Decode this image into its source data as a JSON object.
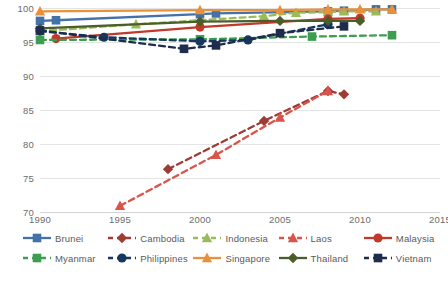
{
  "chart_data": {
    "type": "line",
    "title": "",
    "subtitle": "",
    "xlabel": "",
    "ylabel": "",
    "xlim": [
      1990,
      2015
    ],
    "ylim": [
      70,
      100
    ],
    "xticks": [
      1990,
      1995,
      2000,
      2005,
      2010,
      2015
    ],
    "yticks": [
      70,
      75,
      80,
      85,
      90,
      95,
      100
    ],
    "grid": "horizontal",
    "legend_position": "bottom",
    "legend_columns": 5,
    "background": "#ffffff",
    "gridline_color": "#e4e4e4",
    "tick_label_color": "#6c6c6c",
    "series": [
      {
        "name": "Brunei",
        "color": "#4472a8",
        "marker": "square",
        "dash": "solid",
        "x": [
          1990,
          1991,
          2000,
          2001,
          2008,
          2009,
          2011,
          2012
        ],
        "values": [
          98.1,
          98.2,
          99.1,
          99.2,
          99.5,
          99.6,
          99.8,
          99.8
        ]
      },
      {
        "name": "Cambodia",
        "color": "#9e3b35",
        "marker": "diamond",
        "dash": "dashed",
        "x": [
          1998,
          2004,
          2008,
          2009
        ],
        "values": [
          76.3,
          83.4,
          87.8,
          87.3
        ]
      },
      {
        "name": "Indonesia",
        "color": "#9bbb59",
        "marker": "triangle",
        "dash": "dashed",
        "x": [
          1990,
          1996,
          2004,
          2006,
          2008,
          2009,
          2011
        ],
        "values": [
          96.6,
          97.6,
          98.8,
          99.3,
          99.4,
          99.5,
          99.5
        ]
      },
      {
        "name": "Laos",
        "color": "#d9544a",
        "marker": "triangle",
        "dash": "dashed",
        "x": [
          1995,
          2001,
          2005,
          2008
        ],
        "values": [
          70.9,
          78.4,
          83.9,
          87.8
        ]
      },
      {
        "name": "Malaysia",
        "color": "#c0392b",
        "marker": "circle",
        "dash": "solid",
        "x": [
          1991,
          2000,
          2008,
          2010
        ],
        "values": [
          95.5,
          97.2,
          98.4,
          98.5
        ]
      },
      {
        "name": "Myanmar",
        "color": "#3d9e50",
        "marker": "square",
        "dash": "dashed",
        "x": [
          1990,
          2000,
          2007,
          2012
        ],
        "values": [
          95.3,
          95.4,
          95.8,
          96.0
        ]
      },
      {
        "name": "Philippines",
        "color": "#17375e",
        "marker": "circle",
        "dash": "dashed",
        "x": [
          1990,
          1994,
          2000,
          2003,
          2008
        ],
        "values": [
          96.6,
          95.7,
          95.1,
          95.3,
          97.6
        ]
      },
      {
        "name": "Singapore",
        "color": "#e8913a",
        "marker": "triangle",
        "dash": "solid",
        "x": [
          1990,
          2000,
          2005,
          2008,
          2010,
          2012
        ],
        "values": [
          99.5,
          99.7,
          99.7,
          99.8,
          99.8,
          99.8
        ]
      },
      {
        "name": "Thailand",
        "color": "#4a5e2a",
        "marker": "diamond",
        "dash": "solid",
        "x": [
          1990,
          2000,
          2005,
          2008,
          2010
        ],
        "values": [
          97.0,
          98.0,
          98.1,
          98.1,
          98.1
        ]
      },
      {
        "name": "Vietnam",
        "color": "#1f2d4d",
        "marker": "square",
        "dash": "dashed",
        "x": [
          1990,
          1999,
          2001,
          2005,
          2009
        ],
        "values": [
          96.7,
          94.0,
          94.5,
          96.3,
          97.3
        ]
      }
    ]
  },
  "axes": {
    "y_labels": [
      "100",
      "95",
      "90",
      "85",
      "80",
      "75",
      "70"
    ],
    "x_labels": [
      "1990",
      "1995",
      "2000",
      "2005",
      "2010",
      "2015"
    ]
  },
  "legend": {
    "row1": [
      {
        "label": "Brunei"
      },
      {
        "label": "Cambodia"
      },
      {
        "label": "Indonesia"
      },
      {
        "label": "Laos"
      },
      {
        "label": "Malaysia"
      }
    ],
    "row2": [
      {
        "label": "Myanmar"
      },
      {
        "label": "Philippines"
      },
      {
        "label": "Singapore"
      },
      {
        "label": "Thailand"
      },
      {
        "label": "Vietnam"
      }
    ]
  }
}
